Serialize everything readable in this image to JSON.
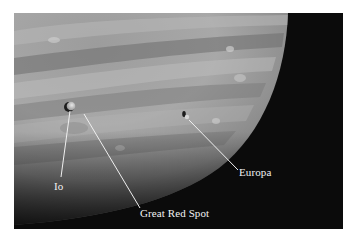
{
  "figure": {
    "labels": {
      "io": "Io",
      "great_red_spot": "Great Red Spot",
      "europa": "Europa"
    },
    "colors": {
      "background": "#ffffff",
      "space": "#0b0b0b",
      "label_text": "#f2f2f2"
    }
  }
}
